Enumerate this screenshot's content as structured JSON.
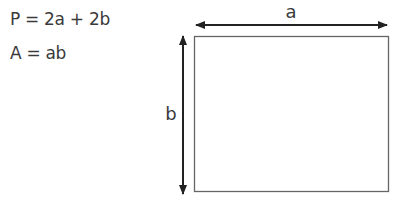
{
  "formulas": {
    "perimeter": "P = 2a + 2b",
    "area": "A = ab"
  },
  "diagram": {
    "shape": "rectangle",
    "width_label": "a",
    "height_label": "b",
    "stroke_color": "#555555",
    "arrow_color": "#222222"
  }
}
